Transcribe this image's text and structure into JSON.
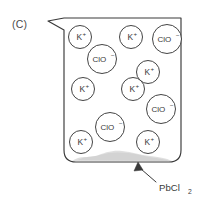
{
  "figure": {
    "panel_label": "(C)",
    "background_color": "#ffffff",
    "line_color": "#3a3a3a",
    "text_color": "#3a3a3a"
  },
  "beaker": {
    "name": "beaker",
    "has_spout": true,
    "spout_side": "left",
    "outline_color": "#3a3a3a",
    "fill_color": "#ffffff"
  },
  "precipitate": {
    "label": "PbCl2",
    "formula_base": "PbCl",
    "formula_subscript": "2",
    "color": "#d9d9d9",
    "description": "solid settled at bottom of beaker"
  },
  "annotation": {
    "arrow_label": "PbCl",
    "arrow_label_subscript": "2",
    "arrow_points_to": "precipitate"
  },
  "ions": [
    {
      "id": "k1",
      "species": "K",
      "charge": "+",
      "cx": 80,
      "cy": 37,
      "r": 11.5
    },
    {
      "id": "k2",
      "species": "K",
      "charge": "+",
      "cx": 131,
      "cy": 37,
      "r": 11.5
    },
    {
      "id": "clo1",
      "species": "ClO",
      "charge": "−",
      "cx": 167,
      "cy": 39,
      "r": 14.5
    },
    {
      "id": "clo2",
      "species": "ClO",
      "charge": "−",
      "cx": 102,
      "cy": 59,
      "r": 14.5
    },
    {
      "id": "k3",
      "species": "K",
      "charge": "+",
      "cx": 148,
      "cy": 72,
      "r": 11.5
    },
    {
      "id": "k4",
      "species": "K",
      "charge": "+",
      "cx": 83,
      "cy": 89,
      "r": 11.5
    },
    {
      "id": "k5",
      "species": "K",
      "charge": "+",
      "cx": 133,
      "cy": 89,
      "r": 11.5
    },
    {
      "id": "clo3",
      "species": "ClO",
      "charge": "−",
      "cx": 161,
      "cy": 109,
      "r": 14.5
    },
    {
      "id": "clo4",
      "species": "ClO",
      "charge": "−",
      "cx": 110,
      "cy": 127,
      "r": 14.5
    },
    {
      "id": "k6",
      "species": "K",
      "charge": "+",
      "cx": 81,
      "cy": 142,
      "r": 11.5
    },
    {
      "id": "k7",
      "species": "K",
      "charge": "+",
      "cx": 148,
      "cy": 142,
      "r": 11.5
    }
  ]
}
